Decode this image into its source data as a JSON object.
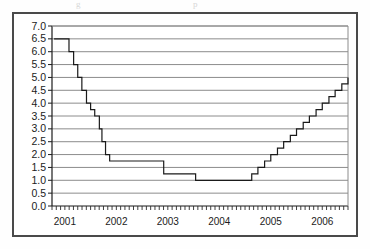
{
  "figure": {
    "top_fragment_left": "g",
    "top_fragment_right": "p",
    "background": "#ffffff",
    "border_color": "#4a4a4a",
    "grid_color": "#8c8c8c",
    "line_color": "#1a1a1a"
  },
  "chart_data": {
    "type": "line",
    "title": "",
    "subtitle": "",
    "xlabel": "",
    "ylabel": "",
    "style": "step",
    "grid": true,
    "legend": null,
    "ylim": [
      0.0,
      7.0
    ],
    "ytick_step": 0.5,
    "yticks": [
      "0.0",
      "0.5",
      "1.0",
      "1.5",
      "2.0",
      "2.5",
      "3.0",
      "3.5",
      "4.0",
      "4.5",
      "5.0",
      "5.5",
      "6.0",
      "6.5",
      "7.0"
    ],
    "ytick_values": [
      0.0,
      0.5,
      1.0,
      1.5,
      2.0,
      2.5,
      3.0,
      3.5,
      4.0,
      4.5,
      5.0,
      5.5,
      6.0,
      6.5,
      7.0
    ],
    "xlim": [
      2000.75,
      2006.5
    ],
    "xticks": [
      "2001",
      "2002",
      "2003",
      "2004",
      "2005",
      "2006"
    ],
    "xtick_values": [
      2001,
      2002,
      2003,
      2004,
      2005,
      2006
    ],
    "minor_xticks": "monthly",
    "x": [
      2000.79,
      2001.0,
      2001.08,
      2001.17,
      2001.25,
      2001.33,
      2001.42,
      2001.5,
      2001.58,
      2001.67,
      2001.72,
      2001.79,
      2001.87,
      2002.92,
      2003.54,
      2004.5,
      2004.63,
      2004.75,
      2004.88,
      2005.0,
      2005.13,
      2005.25,
      2005.38,
      2005.5,
      2005.63,
      2005.75,
      2005.88,
      2006.0,
      2006.13,
      2006.25,
      2006.38,
      2006.5
    ],
    "values": [
      6.5,
      6.5,
      6.0,
      5.5,
      5.0,
      4.5,
      4.0,
      3.75,
      3.5,
      3.0,
      2.5,
      2.0,
      1.75,
      1.25,
      1.0,
      1.0,
      1.25,
      1.5,
      1.75,
      2.0,
      2.25,
      2.5,
      2.75,
      3.0,
      3.25,
      3.5,
      3.75,
      4.0,
      4.25,
      4.5,
      4.75,
      5.0
    ],
    "annotations": [],
    "series_note": "Target interest rate, step series: peak 6.5 in 2001, trough 1.0 mid-2003 to mid-2004, rising to 5.0 by mid-2006"
  }
}
